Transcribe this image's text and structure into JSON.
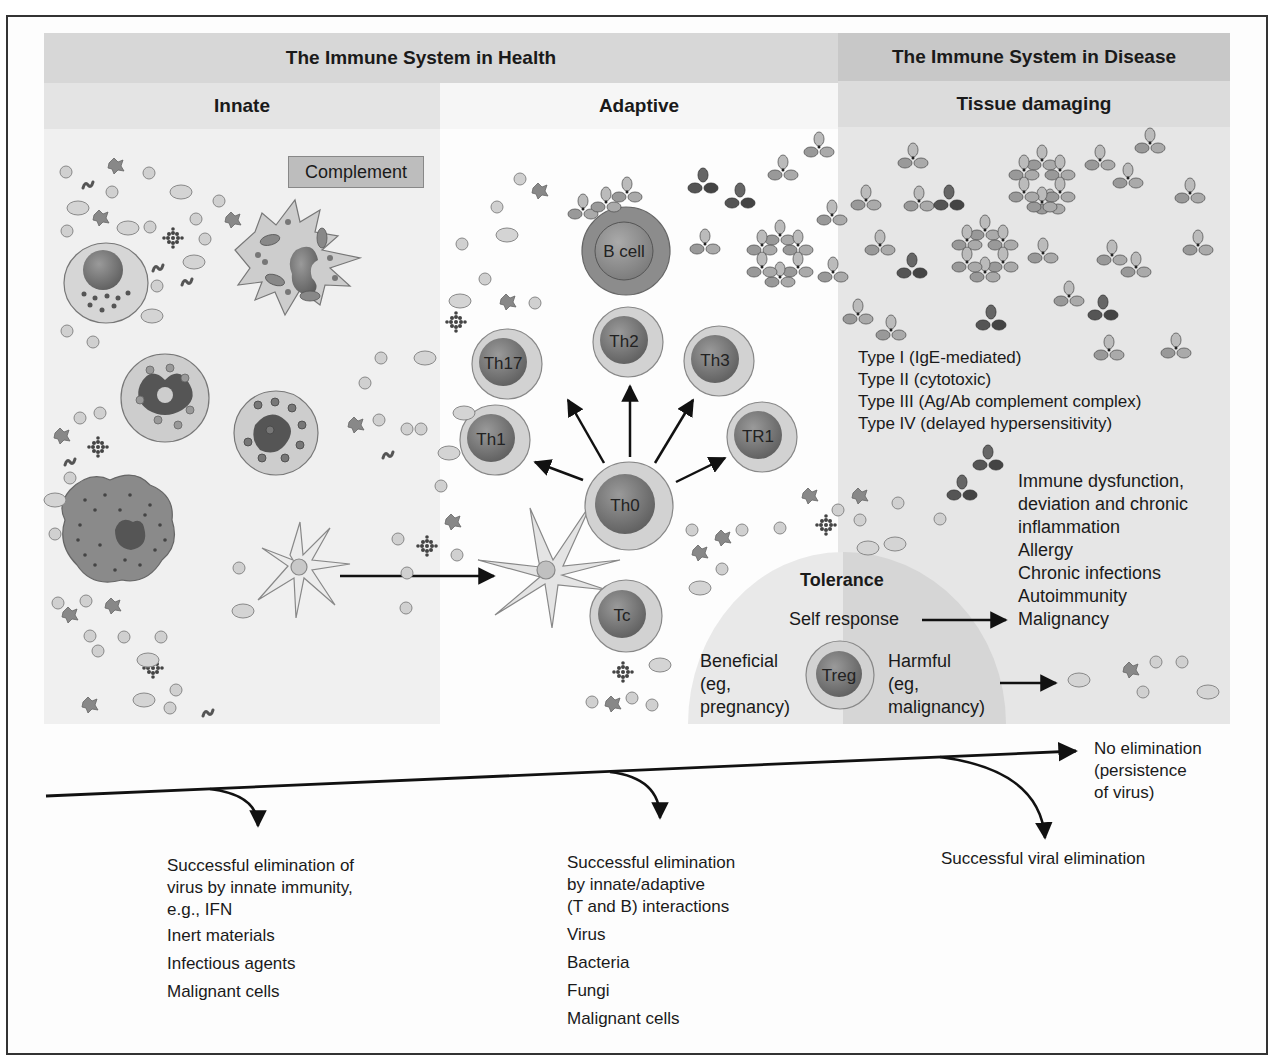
{
  "header": {
    "health_title": "The Immune System in Health",
    "disease_title": "The Immune System in Disease",
    "innate_label": "Innate",
    "adaptive_label": "Adaptive",
    "tissue_label": "Tissue damaging"
  },
  "innate": {
    "complement_label": "Complement"
  },
  "adaptive": {
    "cells": {
      "b_cell": "B cell",
      "th0": "Th0",
      "th1": "Th1",
      "th2": "Th2",
      "th3": "Th3",
      "th17": "Th17",
      "tr1": "TR1",
      "tc": "Tc",
      "treg": "Treg"
    }
  },
  "disease": {
    "hypersensitivity_types": [
      "Type I (IgE-mediated)",
      "Type II (cytotoxic)",
      "Type III (Ag/Ab complement complex)",
      "Type IV (delayed hypersensitivity)"
    ],
    "outcomes": [
      "Immune dysfunction,",
      "deviation and chronic",
      "inflammation",
      "Allergy",
      "Chronic infections",
      "Autoimmunity",
      "Malignancy"
    ]
  },
  "tolerance": {
    "title": "Tolerance",
    "self_response": "Self response",
    "beneficial": [
      "Beneficial",
      "(eg,",
      "pregnancy)"
    ],
    "harmful": [
      "Harmful",
      "(eg,",
      "malignancy)"
    ]
  },
  "outcomes_timeline": {
    "innate_elimination": {
      "lines": [
        "Successful elimination of",
        "virus by innate immunity,",
        "e.g., IFN"
      ],
      "items": [
        "Inert materials",
        "Infectious agents",
        "Malignant cells"
      ]
    },
    "adaptive_elimination": {
      "lines": [
        "Successful elimination",
        "by innate/adaptive",
        "(T and B) interactions"
      ],
      "items": [
        "Virus",
        "Bacteria",
        "Fungi",
        "Malignant cells"
      ]
    },
    "viral_elimination": "Successful viral elimination",
    "no_elimination": [
      "No elimination",
      "(persistence",
      "of virus)"
    ]
  },
  "colors": {
    "band_health": "#d7d7d7",
    "band_disease": "#c8c8c8",
    "cell_outer": "#d2d2d2",
    "cell_nucleus": "#7a7a7a",
    "b_cell_outer": "#8c8c8c",
    "tolerance_light": "#e9e9e9",
    "tolerance_dark": "#d4d4d4"
  }
}
